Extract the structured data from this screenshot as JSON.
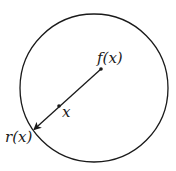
{
  "diagram": {
    "labels": {
      "f": "f(x)",
      "x": "x",
      "r": "r(x)"
    },
    "colors": {
      "stroke": "#1a1a1a",
      "background": "#ffffff"
    },
    "circle": {
      "cx": 94,
      "cy": 88,
      "r": 74
    },
    "points": {
      "f": {
        "x": 101,
        "y": 69
      },
      "x": {
        "x": 59,
        "y": 106
      },
      "r": {
        "x": 33,
        "y": 130
      }
    }
  }
}
